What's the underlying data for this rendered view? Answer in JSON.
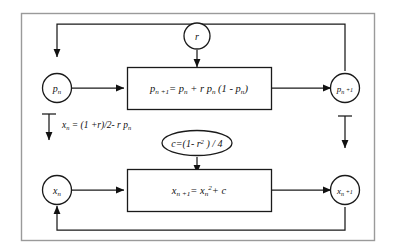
{
  "diagram": {
    "frame": {
      "label": "outer-frame",
      "border_color": "#9a9a9a",
      "background": "#ffffff"
    },
    "ink_color": "#111111",
    "nodes": {
      "p_n": {
        "label": "p",
        "subscript": "n",
        "full": "p_n"
      },
      "p_n1": {
        "label": "p",
        "subscript": "n +1",
        "full": "p_n+1"
      },
      "x_n": {
        "label": "x",
        "subscript": "n",
        "full": "x_n"
      },
      "x_n1": {
        "label": "x",
        "subscript": "n +1",
        "full": "x_n+1"
      },
      "r": {
        "label": "r",
        "full": "r"
      }
    },
    "boxes": {
      "logistic": {
        "name": "logistic-map-equation",
        "lhs": "p",
        "lhs_sub": "n +1",
        "rhs": "= p_n + r p_n (1 - p_n)",
        "full": "p n+1 = p n + r p n (1 - p n)"
      },
      "quadratic": {
        "name": "quadratic-map-equation",
        "lhs": "x",
        "lhs_sub": "n +1",
        "rhs": "= x_n^2 + c",
        "full": "x n+1 = x n ^2 + c"
      }
    },
    "ellipse": {
      "name": "c-definition",
      "full": "c=(1- r^2 ) / 4"
    },
    "side_label": {
      "name": "change-of-variable",
      "full": "x n = (1 +r)/2- r p n"
    },
    "edges": [
      {
        "name": "p_n-to-logistic-box",
        "from": "p_n",
        "to": "logistic-box",
        "arrow": true
      },
      {
        "name": "logistic-box-to-p_n1",
        "from": "logistic-box",
        "to": "p_n1",
        "arrow": true
      },
      {
        "name": "r-to-logistic-box",
        "from": "r",
        "to": "logistic-box",
        "arrow": true
      },
      {
        "name": "p_n1-feedback-to-p_n",
        "from": "p_n1",
        "to": "p_n",
        "arrow": true
      },
      {
        "name": "x_n-to-quadratic-box",
        "from": "x_n",
        "to": "quadratic-box",
        "arrow": true
      },
      {
        "name": "quadratic-box-to-x_n1",
        "from": "quadratic-box",
        "to": "x_n1",
        "arrow": true
      },
      {
        "name": "c-to-quadratic-box",
        "from": "c-ellipse",
        "to": "quadratic-box",
        "arrow": true
      },
      {
        "name": "x_n1-feedback-to-x_n",
        "from": "x_n1",
        "to": "x_n",
        "arrow": true
      },
      {
        "name": "left-transform-arrow",
        "from": "p_n",
        "to": "x_n",
        "arrow": true
      },
      {
        "name": "right-transform-arrow",
        "from": "p_n1",
        "to": "x_n1",
        "arrow": true
      }
    ]
  }
}
